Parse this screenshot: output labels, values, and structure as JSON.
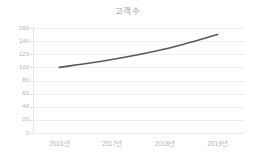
{
  "chart_data": {
    "type": "line",
    "title": "고객수",
    "xlabel": "",
    "ylabel": "",
    "categories": [
      "2016년",
      "2017년",
      "2018년",
      "2019년"
    ],
    "series": [
      {
        "name": "고객수",
        "values": [
          100,
          112,
          128,
          150
        ],
        "color": "#595959"
      }
    ],
    "ylim": [
      0,
      160
    ],
    "yticks": [
      0,
      20,
      40,
      60,
      80,
      100,
      120,
      140,
      160
    ],
    "ytick_labels": [
      "0",
      "20",
      "40",
      "60",
      "80",
      "100",
      "120",
      "140",
      "160"
    ],
    "grid": true,
    "grid_color": "#eeeeee",
    "legend": false,
    "legend_position": "none",
    "smooth": true,
    "markers": false,
    "axis_text_color": "#b5b5b5",
    "title_color": "#9a9a9a",
    "background": "#ffffff"
  }
}
